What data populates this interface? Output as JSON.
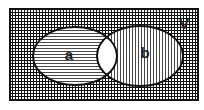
{
  "diagram": {
    "type": "venn",
    "universe_label": "V",
    "sets": [
      {
        "label": "a",
        "shading": "horizontal-lines"
      },
      {
        "label": "b",
        "shading": "vertical-lines"
      }
    ],
    "intersection_shading": "none",
    "universe_shading": "crosshatch",
    "colors": {
      "ink": "#111111",
      "background": "#ffffff"
    }
  }
}
